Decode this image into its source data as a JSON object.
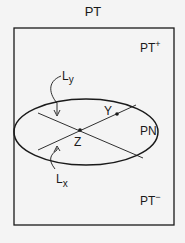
{
  "labels": {
    "title": "PT",
    "pt_plus": "PT",
    "pt_plus_sup": "+",
    "pt_minus": "PT",
    "pt_minus_sup": "−",
    "pn": "PN",
    "ly_main": "L",
    "ly_sub": "y",
    "lx_main": "L",
    "lx_sub": "x",
    "y_point": "Y",
    "z_point": "Z"
  },
  "colors": {
    "background": "#f4f4f4",
    "ink": "#1a1a1a"
  }
}
